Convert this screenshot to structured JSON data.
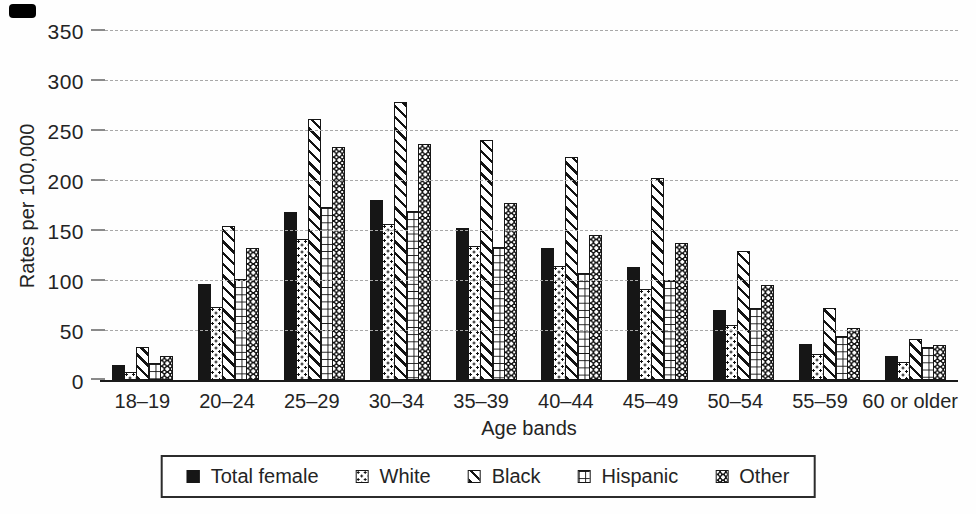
{
  "chart_data": {
    "type": "bar",
    "xlabel": "Age bands",
    "ylabel": "Rates per 100,000",
    "ylim": [
      0,
      350
    ],
    "yticks": [
      0,
      50,
      100,
      150,
      200,
      250,
      300,
      350
    ],
    "grid": "horizontal-dashed",
    "legend_position": "bottom-outside-boxed",
    "categories": [
      "18–19",
      "20–24",
      "25–29",
      "30–34",
      "35–39",
      "40–44",
      "45–49",
      "50–54",
      "55–59",
      "60 or older"
    ],
    "series": [
      {
        "name": "Total female",
        "pattern": "solid-black",
        "values": [
          15,
          96,
          168,
          180,
          152,
          132,
          113,
          70,
          36,
          24
        ]
      },
      {
        "name": "White",
        "pattern": "dots",
        "values": [
          8,
          73,
          141,
          156,
          134,
          114,
          91,
          55,
          26,
          18
        ]
      },
      {
        "name": "Black",
        "pattern": "diagonal-stripes",
        "values": [
          33,
          154,
          261,
          278,
          240,
          223,
          202,
          129,
          72,
          41
        ]
      },
      {
        "name": "Hispanic",
        "pattern": "brick-grid",
        "values": [
          17,
          101,
          173,
          169,
          133,
          107,
          100,
          72,
          44,
          33
        ]
      },
      {
        "name": "Other",
        "pattern": "checker",
        "values": [
          24,
          132,
          233,
          236,
          177,
          145,
          137,
          95,
          52,
          35
        ]
      }
    ],
    "colors": {
      "ink": "#161616",
      "background": "#fefefe",
      "gridline": "#a8a8a8"
    }
  }
}
